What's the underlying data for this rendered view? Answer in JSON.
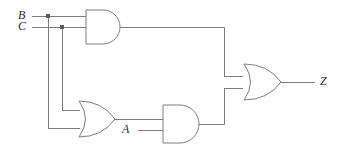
{
  "diagram": {
    "type": "combinational-logic-circuit",
    "background_color": "#ffffff",
    "wire_color": "#7d7d7d",
    "label_color": "#2b2b2b",
    "inputs": [
      {
        "id": "B",
        "label": "B",
        "x": 18,
        "y": 10
      },
      {
        "id": "C",
        "label": "C",
        "x": 18,
        "y": 21
      },
      {
        "id": "A",
        "label": "A",
        "x": 122,
        "y": 124
      }
    ],
    "outputs": [
      {
        "id": "Z",
        "label": "Z",
        "x": 320,
        "y": 75
      }
    ],
    "gates": [
      {
        "id": "and-top",
        "type": "AND",
        "inputs": [
          "B",
          "C"
        ],
        "output": "and-top-out"
      },
      {
        "id": "or-bottom",
        "type": "OR",
        "inputs": [
          "B",
          "C"
        ],
        "output": "or-bottom-out"
      },
      {
        "id": "and-bottom",
        "type": "AND",
        "inputs": [
          "or-bottom-out",
          "A"
        ],
        "output": "and-bottom-out"
      },
      {
        "id": "or-right",
        "type": "OR",
        "inputs": [
          "and-top-out",
          "and-bottom-out"
        ],
        "output": "Z"
      }
    ],
    "junctions": [
      {
        "id": "junction-b",
        "x": 48,
        "y": 16
      },
      {
        "id": "junction-c",
        "x": 62,
        "y": 27
      }
    ]
  }
}
